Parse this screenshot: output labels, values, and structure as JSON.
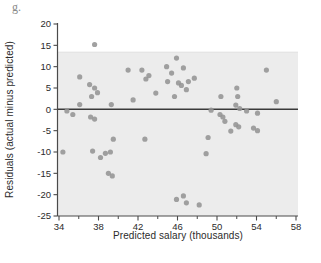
{
  "figure_label": "g.",
  "colors": {
    "page_bg": "#ffffff",
    "band_bg": "#ececec",
    "band_edge": "#e0e0e0",
    "point": "#949494",
    "zero_line": "#3a3a3a",
    "axis": "#4a4a4a",
    "tick_text": "#2b2b2b"
  },
  "chart_data": {
    "type": "scatter",
    "title": "",
    "xlabel": "Predicted salary (thousands)",
    "ylabel": "Residuals (actual minus predicted)",
    "xlim": [
      34,
      58
    ],
    "ylim": [
      -25,
      20
    ],
    "x_major_ticks": [
      34,
      38,
      42,
      46,
      50,
      54,
      58
    ],
    "x_minor_ticks": [
      36,
      40,
      44,
      48,
      52,
      56
    ],
    "y_ticks": [
      20,
      15,
      10,
      5,
      0,
      -5,
      -10,
      -15,
      -20,
      -25
    ],
    "grid": false,
    "legend": false,
    "zero_line_y": 0,
    "shaded_band": {
      "y_top": 13.4,
      "y_bottom": -25
    },
    "points": [
      [
        37.6,
        15.2
      ],
      [
        36.1,
        7.6
      ],
      [
        37.1,
        5.8
      ],
      [
        37.6,
        5.0
      ],
      [
        37.9,
        3.9
      ],
      [
        37.3,
        3.0
      ],
      [
        36.1,
        1.1
      ],
      [
        39.3,
        1.1
      ],
      [
        41.5,
        2.2
      ],
      [
        34.8,
        -0.4
      ],
      [
        35.4,
        -1.2
      ],
      [
        37.2,
        -1.8
      ],
      [
        37.6,
        -2.3
      ],
      [
        41.0,
        9.2
      ],
      [
        42.4,
        9.2
      ],
      [
        42.8,
        7.1
      ],
      [
        43.1,
        7.9
      ],
      [
        44.9,
        10.0
      ],
      [
        45.9,
        12.0
      ],
      [
        46.6,
        9.7
      ],
      [
        45.4,
        8.5
      ],
      [
        45.0,
        6.5
      ],
      [
        46.1,
        6.2
      ],
      [
        46.4,
        5.6
      ],
      [
        47.1,
        6.5
      ],
      [
        47.7,
        7.3
      ],
      [
        46.9,
        4.6
      ],
      [
        43.8,
        3.8
      ],
      [
        45.7,
        3.0
      ],
      [
        34.4,
        -10.0
      ],
      [
        37.4,
        -9.8
      ],
      [
        38.2,
        -11.3
      ],
      [
        38.7,
        -10.3
      ],
      [
        39.2,
        -10.0
      ],
      [
        39.5,
        -7.0
      ],
      [
        42.7,
        -7.0
      ],
      [
        39.0,
        -15.0
      ],
      [
        39.4,
        -15.6
      ],
      [
        48.9,
        -10.4
      ],
      [
        49.1,
        -6.6
      ],
      [
        49.4,
        -0.2
      ],
      [
        50.3,
        -1.2
      ],
      [
        50.6,
        -1.8
      ],
      [
        50.8,
        -2.8
      ],
      [
        51.4,
        -5.1
      ],
      [
        50.4,
        3.0
      ],
      [
        52.1,
        3.0
      ],
      [
        51.9,
        1.0
      ],
      [
        52.3,
        0.2
      ],
      [
        53.0,
        -0.4
      ],
      [
        54.1,
        -0.9
      ],
      [
        56.0,
        1.8
      ],
      [
        55.0,
        9.2
      ],
      [
        52.0,
        5.0
      ],
      [
        51.9,
        -3.6
      ],
      [
        52.2,
        -4.1
      ],
      [
        53.7,
        -4.4
      ],
      [
        54.1,
        -5.0
      ],
      [
        45.9,
        -21.1
      ],
      [
        46.6,
        -20.3
      ],
      [
        46.9,
        -21.9
      ],
      [
        48.2,
        -22.4
      ]
    ]
  }
}
